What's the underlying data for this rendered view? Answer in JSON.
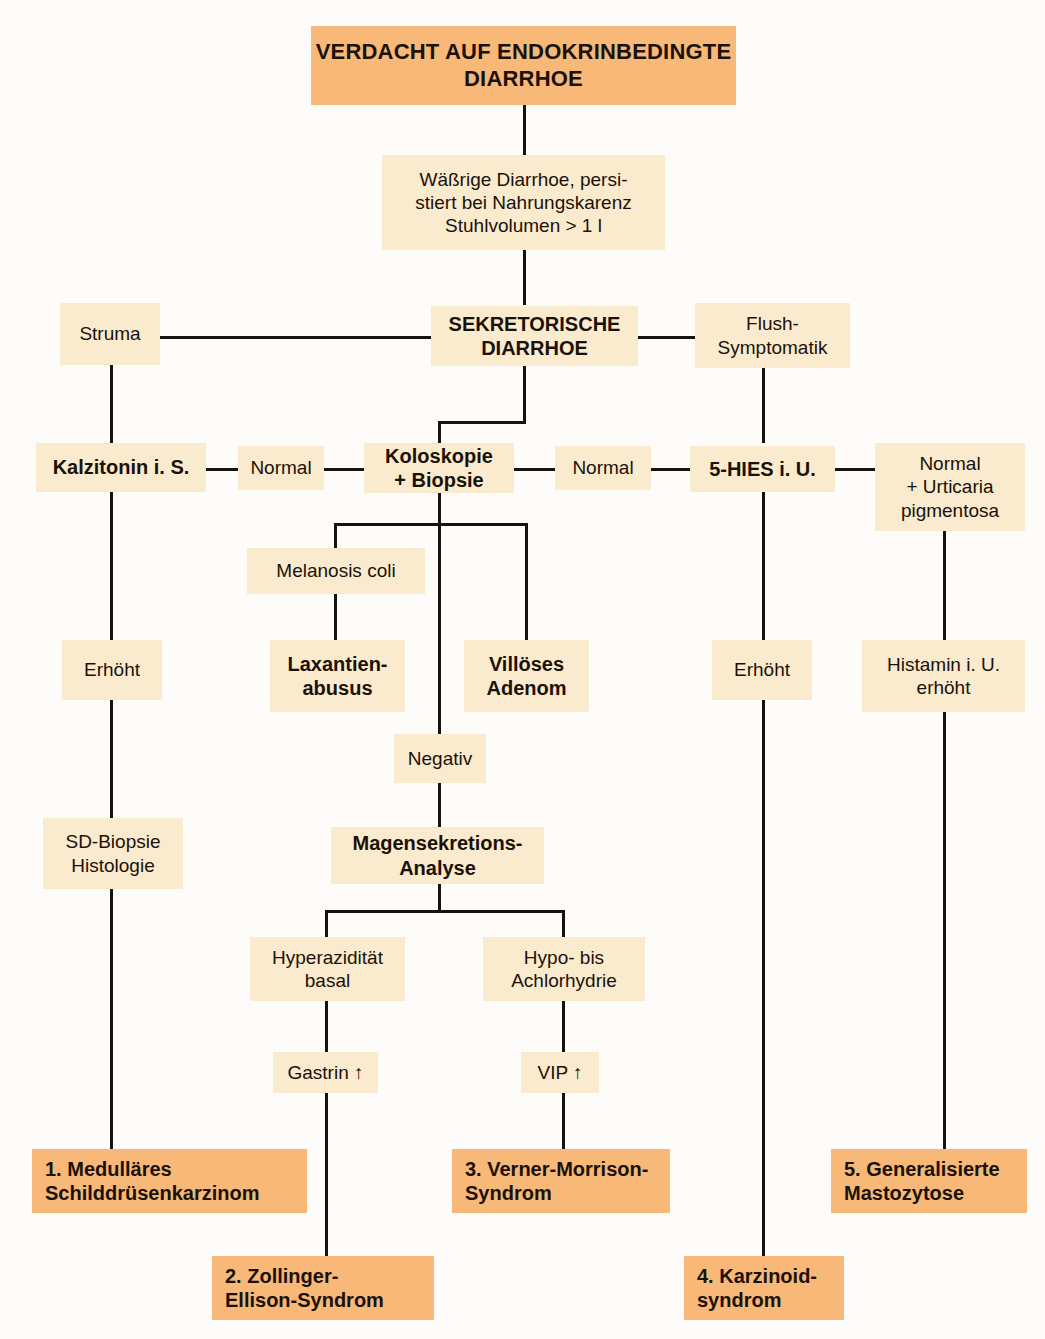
{
  "diagram": {
    "title": "Verdacht auf endokrinbedingte Diarrhoe",
    "language": "de",
    "colors": {
      "highlight": "#f7b878",
      "node": "#faeace",
      "line": "#16120c",
      "background": "#fdfcfa",
      "text": "#1a1209"
    },
    "nodes": {
      "root": "VERDACHT AUF ENDOKRINBEDINGTE\nDIARRHOE",
      "watery": "Wäßrige Diarrhoe, persi-\nstiert bei Nahrungskarenz\nStuhlvolumen > 1 l",
      "struma": "Struma",
      "secretory": "SEKRETORISCHE\nDIARRHOE",
      "flush": "Flush-\nSymptomatik",
      "calcitonin": "Kalzitonin i. S.",
      "normal_left": "Normal",
      "colonoscopy": "Koloskopie\n+ Biopsie",
      "normal_right": "Normal",
      "hies": "5-HIES i. U.",
      "normal_urticaria": "Normal\n+ Urticaria\npigmentosa",
      "melanosis": "Melanosis coli",
      "elevated_left": "Erhöht",
      "laxative": "Laxantien-\nabusus",
      "villous": "Villöses\nAdenom",
      "elevated_right": "Erhöht",
      "histamine": "Histamin i. U.\nerhöht",
      "negative": "Negativ",
      "sd_biopsy": "SD-Biopsie\nHistologie",
      "gastric_analysis": "Magensekretions-\nAnalyse",
      "hyperacidity": "Hyperazidität\nbasal",
      "hypoacidity": "Hypo- bis\nAchlorhydrie",
      "gastrin": "Gastrin ↑",
      "vip": "VIP ↑",
      "dx1": "1. Medulläres\n    Schilddrüsenkarzinom",
      "dx2": "2. Zollinger-\n    Ellison-Syndrom",
      "dx3": "3. Verner-Morrison-\n    Syndrom",
      "dx4": "4. Karzinoid-\n    syndrom",
      "dx5": "5. Generalisierte\n    Mastozytose"
    }
  }
}
